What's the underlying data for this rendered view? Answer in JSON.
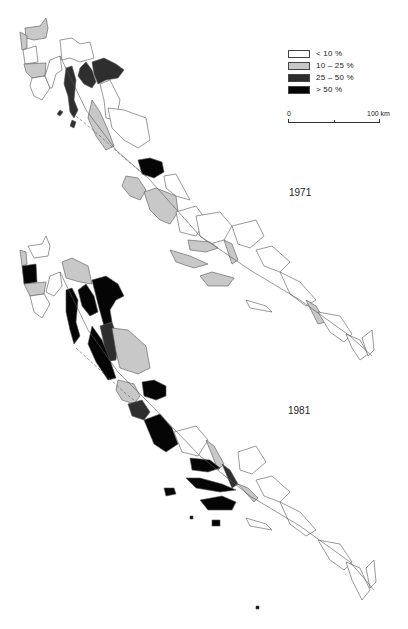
{
  "figure": {
    "type": "choropleth-map-pair",
    "region": "Adriatic coast (administrative districts and islands)",
    "maps": [
      {
        "year_label": "1971",
        "position": "top"
      },
      {
        "year_label": "1981",
        "position": "bottom"
      }
    ]
  },
  "legend": {
    "items": [
      {
        "label": "< 10 %",
        "color": "#ffffff"
      },
      {
        "label": "10 – 25 %",
        "color": "#c8c8c8"
      },
      {
        "label": "25 – 50 %",
        "color": "#2e2e2e"
      },
      {
        "label": "> 50 %",
        "color": "#050505"
      }
    ]
  },
  "scale_bar": {
    "start_label": "0",
    "end_label": "100 km"
  },
  "colors": {
    "background": "#ffffff",
    "outline": "#555555",
    "class_low": "#ffffff",
    "class_mid_low": "#c8c8c8",
    "class_mid_high": "#2e2e2e",
    "class_high": "#050505"
  }
}
